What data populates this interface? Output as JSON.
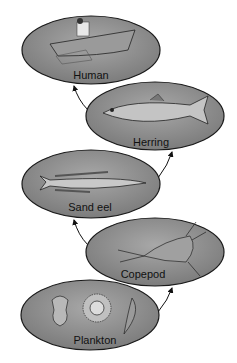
{
  "diagram": {
    "type": "food-chain",
    "nodes": [
      {
        "id": "plankton",
        "label": "Plankton"
      },
      {
        "id": "copepod",
        "label": "Copepod"
      },
      {
        "id": "sand_eel",
        "label": "Sand eel"
      },
      {
        "id": "herring",
        "label": "Herring"
      },
      {
        "id": "human",
        "label": "Human"
      }
    ],
    "edges": [
      {
        "from": "plankton",
        "to": "copepod"
      },
      {
        "from": "copepod",
        "to": "sand_eel"
      },
      {
        "from": "sand_eel",
        "to": "herring"
      },
      {
        "from": "herring",
        "to": "human"
      }
    ],
    "colors": {
      "ellipse_fill": "#8c8c8c",
      "ellipse_stroke": "#1a1a1a",
      "arrow": "#111111"
    }
  }
}
